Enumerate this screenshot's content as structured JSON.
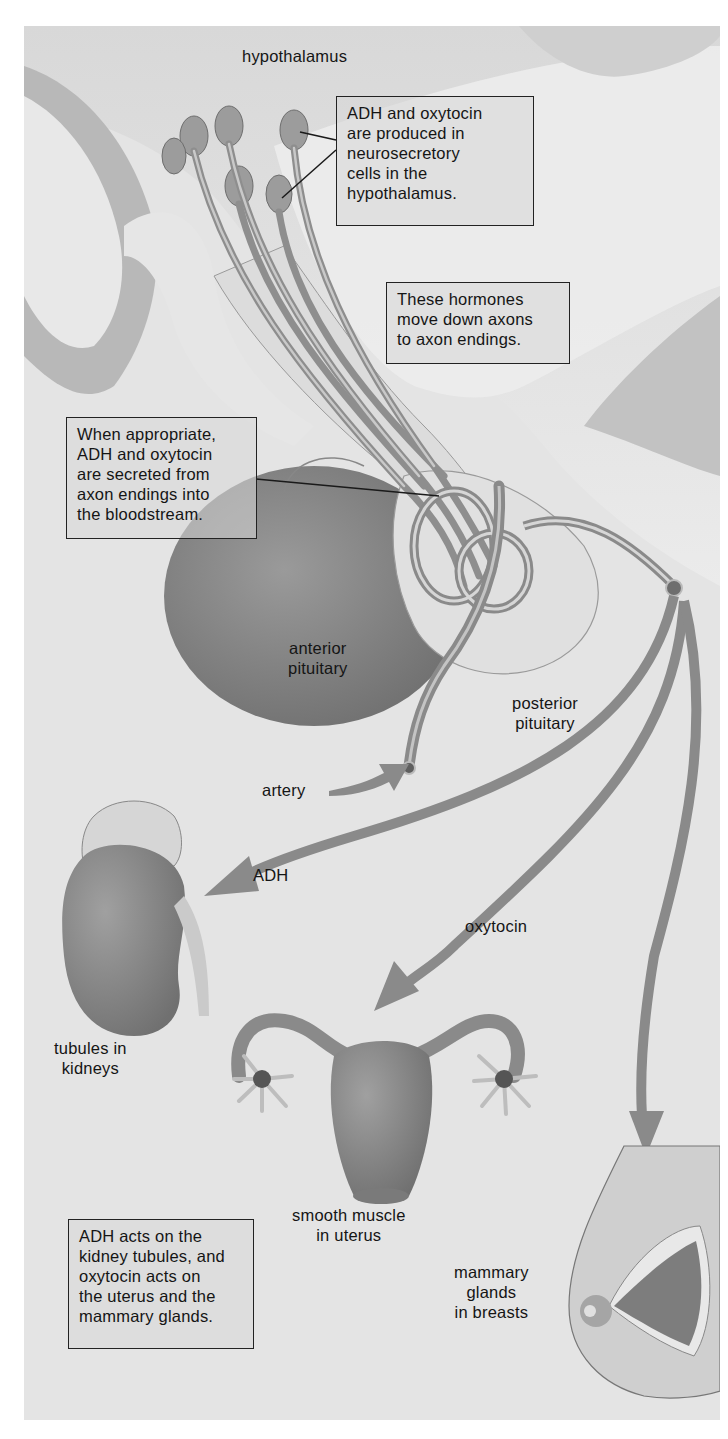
{
  "diagram": {
    "title_label": "hypothalamus",
    "callouts": {
      "production": "ADH and oxytocin\nare produced in\nneurosecretory\ncells in the\nhypothalamus.",
      "transport": "These hormones\nmove down axons\nto axon endings.",
      "secretion": "When appropriate,\nADH and oxytocin\nare secreted from\naxon endings into\nthe bloodstream.",
      "summary": "ADH acts on the\nkidney tubules, and\noxytocin acts on\nthe uterus and the\nmammary glands."
    },
    "labels": {
      "anterior_pituitary": "anterior\npituitary",
      "posterior_pituitary": "posterior\npituitary",
      "artery": "artery",
      "adh": "ADH",
      "oxytocin": "oxytocin",
      "kidneys": "tubules in\nkidneys",
      "uterus": "smooth muscle\nin uterus",
      "mammary": "mammary\nglands\nin breasts"
    },
    "colors": {
      "background": "#e4e4e4",
      "dark_tissue": "#b4b4b4",
      "pale_band": "#ededed",
      "organ": "#8c8c8c",
      "arrow": "#8a8a8a",
      "border": "#222222"
    }
  }
}
